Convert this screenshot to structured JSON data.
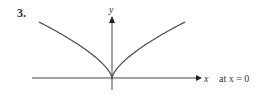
{
  "problem_number": "3.",
  "chart_data": {
    "type": "line",
    "title": "",
    "xlabel": "x",
    "ylabel": "y",
    "annotation": "at x = 0",
    "curve": "cusp y = |x|^(2/3)",
    "xlim": [
      -1.7,
      1.7
    ],
    "ylim": [
      -0.3,
      1.5
    ],
    "series": [
      {
        "name": "curve",
        "function": "abs_pow",
        "exponent": 0.6667,
        "x_range": [
          -1.6,
          1.6
        ]
      }
    ],
    "grid": false,
    "legend": "none"
  },
  "colors": {
    "curve": "#4a4a4a",
    "axis": "#333333",
    "text": "#222222"
  }
}
